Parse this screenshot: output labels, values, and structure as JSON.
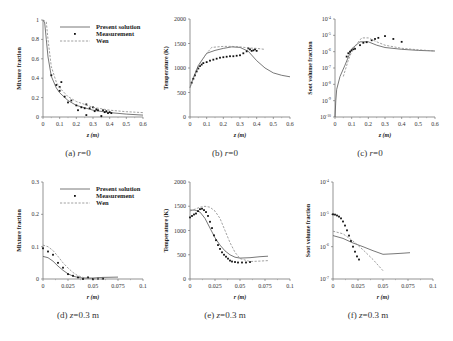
{
  "figure": {
    "legend": [
      "Present solution",
      "Measurement",
      "Wen"
    ]
  },
  "chart_data": [
    {
      "id": "a",
      "type": "line",
      "caption": "(a) r=0",
      "xlabel": "z (m)",
      "ylabel": "Mixture fraction",
      "xlim": [
        0,
        0.6
      ],
      "ylim": [
        0,
        1
      ],
      "yscale": "linear",
      "xticks": [
        "0",
        "0.1",
        "0.2",
        "0.3",
        "0.4",
        "0.5",
        "0.6"
      ],
      "yticks": [
        "0",
        "0.2",
        "0.4",
        "0.6",
        "0.8",
        "1"
      ],
      "legend_visible": true,
      "series": [
        {
          "name": "Present solution",
          "style": "solid",
          "x": [
            0,
            0.01,
            0.02,
            0.03,
            0.05,
            0.08,
            0.1,
            0.15,
            0.2,
            0.3,
            0.4,
            0.5,
            0.6
          ],
          "y": [
            1,
            0.97,
            0.8,
            0.62,
            0.42,
            0.3,
            0.25,
            0.17,
            0.12,
            0.07,
            0.045,
            0.03,
            0.02
          ]
        },
        {
          "name": "Measurement",
          "style": "marker",
          "x": [
            0.05,
            0.08,
            0.1,
            0.1,
            0.11,
            0.13,
            0.15,
            0.17,
            0.2,
            0.21,
            0.23,
            0.25,
            0.26,
            0.26,
            0.28,
            0.3,
            0.31,
            0.32,
            0.33,
            0.35,
            0.36,
            0.37,
            0.38,
            0.39,
            0.4,
            0.41
          ],
          "y": [
            0.43,
            0.33,
            0.31,
            0.27,
            0.36,
            0.21,
            0.15,
            0.17,
            0.12,
            0.07,
            0.1,
            0.09,
            0.13,
            0.02,
            0.09,
            0.1,
            0.06,
            0.08,
            0.07,
            0.01,
            0.07,
            0.05,
            0.06,
            0.04,
            0.05,
            0.04
          ]
        },
        {
          "name": "Wen",
          "style": "dashed",
          "x": [
            0,
            0.02,
            0.03,
            0.05,
            0.08,
            0.1,
            0.15,
            0.2,
            0.3,
            0.4,
            0.5,
            0.6
          ],
          "y": [
            1,
            0.98,
            0.8,
            0.52,
            0.36,
            0.3,
            0.21,
            0.16,
            0.1,
            0.07,
            0.055,
            0.045
          ]
        }
      ]
    },
    {
      "id": "b",
      "type": "line",
      "caption": "(b) r=0",
      "xlabel": "z (m)",
      "ylabel": "Temperature (K)",
      "xlim": [
        0,
        0.6
      ],
      "ylim": [
        0,
        2000
      ],
      "yscale": "linear",
      "xticks": [
        "0",
        "0.1",
        "0.2",
        "0.3",
        "0.4",
        "0.5",
        "0.6"
      ],
      "yticks": [
        "0",
        "500",
        "1000",
        "1500",
        "2000"
      ],
      "series": [
        {
          "name": "Present solution",
          "style": "solid",
          "x": [
            0,
            0.02,
            0.05,
            0.08,
            0.1,
            0.15,
            0.2,
            0.25,
            0.3,
            0.35,
            0.4,
            0.45,
            0.5,
            0.55,
            0.6
          ],
          "y": [
            600,
            800,
            1050,
            1200,
            1300,
            1360,
            1400,
            1430,
            1420,
            1340,
            1150,
            1000,
            900,
            850,
            820
          ]
        },
        {
          "name": "Measurement",
          "style": "marker",
          "x": [
            0.01,
            0.02,
            0.03,
            0.04,
            0.05,
            0.06,
            0.07,
            0.08,
            0.1,
            0.12,
            0.14,
            0.16,
            0.18,
            0.2,
            0.22,
            0.24,
            0.26,
            0.28,
            0.3,
            0.32,
            0.34,
            0.35,
            0.36,
            0.37,
            0.38,
            0.39,
            0.4
          ],
          "y": [
            700,
            780,
            850,
            930,
            990,
            1040,
            1070,
            1100,
            1120,
            1150,
            1170,
            1190,
            1210,
            1220,
            1230,
            1240,
            1240,
            1250,
            1260,
            1300,
            1340,
            1400,
            1380,
            1350,
            1360,
            1380,
            1350
          ]
        },
        {
          "name": "Wen",
          "style": "dashed",
          "x": [
            0,
            0.03,
            0.06,
            0.1,
            0.13,
            0.2,
            0.25,
            0.3,
            0.35,
            0.4,
            0.45
          ],
          "y": [
            600,
            850,
            1100,
            1300,
            1420,
            1440,
            1440,
            1430,
            1410,
            1400,
            1380
          ]
        }
      ]
    },
    {
      "id": "c",
      "type": "line",
      "caption": "(c) r=0",
      "xlabel": "z (m)",
      "ylabel": "Soot volume fraction",
      "xlim": [
        0,
        0.6
      ],
      "ylim": [
        1e-10,
        0.0001
      ],
      "yscale": "log",
      "xticks": [
        "0",
        "0.1",
        "0.2",
        "0.3",
        "0.4",
        "0.5",
        "0.6"
      ],
      "yticks": [
        "10^-10",
        "10^-9",
        "10^-8",
        "10^-7",
        "10^-6",
        "10^-5",
        "10^-4"
      ],
      "series": [
        {
          "name": "Present solution",
          "style": "solid",
          "x": [
            0,
            0.005,
            0.01,
            0.03,
            0.06,
            0.1,
            0.15,
            0.2,
            0.25,
            0.3,
            0.4,
            0.5,
            0.6
          ],
          "y": [
            1e-10,
            1e-09,
            5e-09,
            3e-08,
            1.5e-07,
            1.5e-06,
            4e-06,
            4e-06,
            2.5e-06,
            1.8e-06,
            1.4e-06,
            1.2e-06,
            1.1e-06
          ]
        },
        {
          "name": "Measurement",
          "style": "marker",
          "x": [
            0.07,
            0.08,
            0.09,
            0.1,
            0.11,
            0.12,
            0.15,
            0.17,
            0.19,
            0.22,
            0.24,
            0.26,
            0.3,
            0.35,
            0.4
          ],
          "y": [
            5e-07,
            8e-07,
            1e-06,
            1.2e-06,
            1.4e-06,
            1.5e-06,
            2.5e-06,
            3.5e-06,
            3.8e-06,
            5e-06,
            6e-06,
            7e-06,
            9e-06,
            6e-06,
            4e-06
          ]
        },
        {
          "name": "Wen",
          "style": "dashed",
          "x": [
            0.05,
            0.08,
            0.1,
            0.13,
            0.16,
            0.2,
            0.25,
            0.3,
            0.4,
            0.5,
            0.6
          ],
          "y": [
            3e-08,
            3e-07,
            1e-06,
            3e-06,
            7e-06,
            7e-06,
            4e-06,
            2.5e-06,
            1.6e-06,
            1.3e-06,
            1.1e-06
          ]
        }
      ]
    },
    {
      "id": "d",
      "type": "line",
      "caption": "(d) z=0.3 m",
      "xlabel": "r (m)",
      "ylabel": "Mixture fraction",
      "xlim": [
        0,
        0.1
      ],
      "ylim": [
        0,
        0.3
      ],
      "yscale": "linear",
      "xticks": [
        "0",
        "0.025",
        "0.05",
        "0.075",
        "0.1"
      ],
      "yticks": [
        "0",
        "0.1",
        "0.2",
        "0.3"
      ],
      "legend_visible": true,
      "series": [
        {
          "name": "Present solution",
          "style": "solid",
          "x": [
            0,
            0.005,
            0.01,
            0.015,
            0.02,
            0.025,
            0.03,
            0.035,
            0.04,
            0.05,
            0.06,
            0.075
          ],
          "y": [
            0.07,
            0.066,
            0.055,
            0.04,
            0.027,
            0.016,
            0.009,
            0.005,
            0.003,
            0.003,
            0.005,
            0.006
          ]
        },
        {
          "name": "Measurement",
          "style": "marker",
          "x": [
            0,
            0.005,
            0.01,
            0.015,
            0.02,
            0.025,
            0.03,
            0.035,
            0.04,
            0.045,
            0.05,
            0.055,
            0.06
          ],
          "y": [
            0.095,
            0.085,
            0.075,
            0.05,
            0.035,
            0.015,
            0.01,
            0.005,
            0.0,
            0.005,
            0.0,
            0.001,
            0.001
          ]
        },
        {
          "name": "Wen",
          "style": "dashed",
          "x": [
            0,
            0.005,
            0.01,
            0.015,
            0.02,
            0.025,
            0.03,
            0.035,
            0.04,
            0.045,
            0.05,
            0.06
          ],
          "y": [
            0.105,
            0.1,
            0.088,
            0.07,
            0.05,
            0.034,
            0.02,
            0.01,
            0.005,
            0.002,
            0.001,
            0.0
          ]
        }
      ]
    },
    {
      "id": "e",
      "type": "line",
      "caption": "(e) z=0.3 m",
      "xlabel": "r (m)",
      "ylabel": "Temperature (K)",
      "xlim": [
        0,
        0.1
      ],
      "ylim": [
        0,
        2000
      ],
      "yscale": "linear",
      "xticks": [
        "0",
        "0.025",
        "0.05",
        "0.075",
        "0.1"
      ],
      "yticks": [
        "0",
        "500",
        "1000",
        "1500",
        "2000"
      ],
      "series": [
        {
          "name": "Present solution",
          "style": "solid",
          "x": [
            0,
            0.005,
            0.01,
            0.015,
            0.02,
            0.025,
            0.03,
            0.035,
            0.04,
            0.045,
            0.05,
            0.06,
            0.07,
            0.078
          ],
          "y": [
            1420,
            1420,
            1380,
            1250,
            1050,
            850,
            700,
            580,
            500,
            450,
            430,
            440,
            460,
            470
          ]
        },
        {
          "name": "Measurement",
          "style": "marker",
          "x": [
            0,
            0.002,
            0.004,
            0.006,
            0.008,
            0.01,
            0.012,
            0.014,
            0.016,
            0.018,
            0.02,
            0.022,
            0.024,
            0.026,
            0.028,
            0.03,
            0.032,
            0.034,
            0.036,
            0.038,
            0.04,
            0.042,
            0.045,
            0.048,
            0.052,
            0.056,
            0.06
          ],
          "y": [
            1270,
            1300,
            1330,
            1350,
            1400,
            1440,
            1450,
            1420,
            1380,
            1300,
            1180,
            1050,
            900,
            800,
            700,
            620,
            550,
            500,
            460,
            420,
            380,
            360,
            350,
            340,
            340,
            340,
            350
          ]
        },
        {
          "name": "Wen",
          "style": "dashed",
          "x": [
            0,
            0.01,
            0.015,
            0.02,
            0.025,
            0.03,
            0.035,
            0.04,
            0.045,
            0.05,
            0.06,
            0.07,
            0.078
          ],
          "y": [
            1400,
            1480,
            1500,
            1480,
            1400,
            1250,
            1000,
            750,
            550,
            420,
            360,
            370,
            380
          ]
        }
      ]
    },
    {
      "id": "f",
      "type": "line",
      "caption": "(f) z=0.3 m",
      "xlabel": "r (m)",
      "ylabel": "Soot volume fraction",
      "xlim": [
        0,
        0.1
      ],
      "ylim": [
        1e-07,
        0.0001
      ],
      "yscale": "log",
      "xticks": [
        "0",
        "0.025",
        "0.05",
        "0.075",
        "0.1"
      ],
      "yticks": [
        "10^-7",
        "10^-6",
        "10^-5",
        "10^-4"
      ],
      "series": [
        {
          "name": "Present solution",
          "style": "solid",
          "x": [
            0,
            0.01,
            0.02,
            0.03,
            0.04,
            0.05,
            0.06,
            0.07,
            0.077
          ],
          "y": [
            2.2e-06,
            1.8e-06,
            1.3e-06,
            1e-06,
            7.5e-07,
            5.8e-07,
            6e-07,
            6.3e-07,
            6.5e-07
          ]
        },
        {
          "name": "Measurement",
          "style": "marker",
          "x": [
            0,
            0.002,
            0.004,
            0.006,
            0.008,
            0.01,
            0.012,
            0.014,
            0.016,
            0.018,
            0.02,
            0.022,
            0.024,
            0.026
          ],
          "y": [
            1e-05,
            9.8e-06,
            9.2e-06,
            8.5e-06,
            7.5e-06,
            6e-06,
            4.5e-06,
            3.2e-06,
            2.2e-06,
            1.5e-06,
            1e-06,
            7e-07,
            5e-07,
            4e-07
          ]
        },
        {
          "name": "Wen",
          "style": "dashed",
          "x": [
            0,
            0.01,
            0.02,
            0.03,
            0.04,
            0.05
          ],
          "y": [
            3e-06,
            2.5e-06,
            1.5e-06,
            8e-07,
            4e-07,
            1.8e-07
          ]
        }
      ]
    }
  ]
}
